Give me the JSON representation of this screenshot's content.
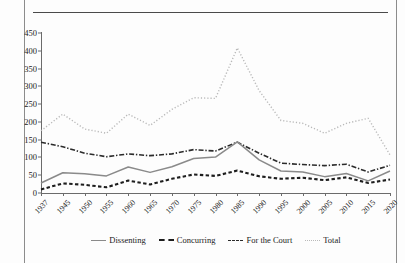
{
  "title_fragment": "",
  "chart_data": {
    "type": "line",
    "title": "",
    "xlabel": "",
    "ylabel": "",
    "ylim": [
      0,
      450
    ],
    "ytick_step": 50,
    "yticks": [
      0,
      50,
      100,
      150,
      200,
      250,
      300,
      350,
      400,
      450
    ],
    "grid": false,
    "legend_position": "bottom",
    "categories": [
      "1937",
      "1945",
      "1950",
      "1955",
      "1960",
      "1965",
      "1970",
      "1975",
      "1980",
      "1985",
      "1990",
      "1995",
      "2000",
      "2005",
      "2010",
      "2015",
      "2020"
    ],
    "series": [
      {
        "name": "Dissenting",
        "style": "solid",
        "color": "#8a8a8a",
        "values": [
          28,
          57,
          54,
          48,
          73,
          58,
          74,
          97,
          101,
          144,
          93,
          62,
          59,
          46,
          55,
          34,
          62
        ]
      },
      {
        "name": "Concurring",
        "style": "dotted-square",
        "color": "#1d1d1d",
        "values": [
          10,
          27,
          23,
          16,
          35,
          24,
          40,
          52,
          48,
          63,
          47,
          40,
          43,
          36,
          44,
          28,
          38
        ]
      },
      {
        "name": "For the Court",
        "style": "dash-dot",
        "color": "#2b2b2b",
        "values": [
          143,
          130,
          112,
          102,
          110,
          105,
          110,
          122,
          118,
          143,
          112,
          84,
          80,
          77,
          81,
          59,
          78
        ]
      },
      {
        "name": "Total",
        "style": "fine-dotted",
        "color": "#b9b9b9",
        "values": [
          175,
          222,
          180,
          168,
          222,
          190,
          235,
          268,
          266,
          408,
          288,
          204,
          196,
          168,
          196,
          210,
          107
        ]
      }
    ]
  },
  "legend": {
    "items": [
      {
        "label": "Dissenting"
      },
      {
        "label": "Concurring"
      },
      {
        "label": "For the Court"
      },
      {
        "label": "Total"
      }
    ]
  }
}
